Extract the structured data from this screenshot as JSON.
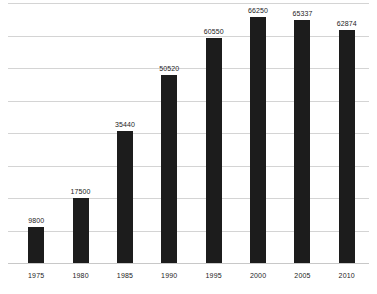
{
  "chart_data": {
    "type": "bar",
    "title": "",
    "subtitle": "",
    "xlabel": "",
    "ylabel": "",
    "categories": [
      "1975",
      "1980",
      "1985",
      "1990",
      "1995",
      "2000",
      "2005",
      "2010"
    ],
    "values": [
      9800,
      17500,
      35440,
      50520,
      60550,
      66250,
      65337,
      62874
    ],
    "value_labels": [
      "9800",
      "17500",
      "35440",
      "50520",
      "60550",
      "66250",
      "65337",
      "62874"
    ],
    "ylim": [
      0,
      70000
    ],
    "grid": true,
    "gridlines": [
      0,
      8750,
      17500,
      26250,
      35000,
      43750,
      52500,
      61250,
      70000
    ],
    "y_tick_labels": [],
    "legend": [],
    "legend_position": "none",
    "bar_color": "#1c1c1c",
    "grid_color": "#d4d4d4",
    "label_color": "#1c1c1c",
    "background_color": "#ffffff",
    "annotations": []
  }
}
